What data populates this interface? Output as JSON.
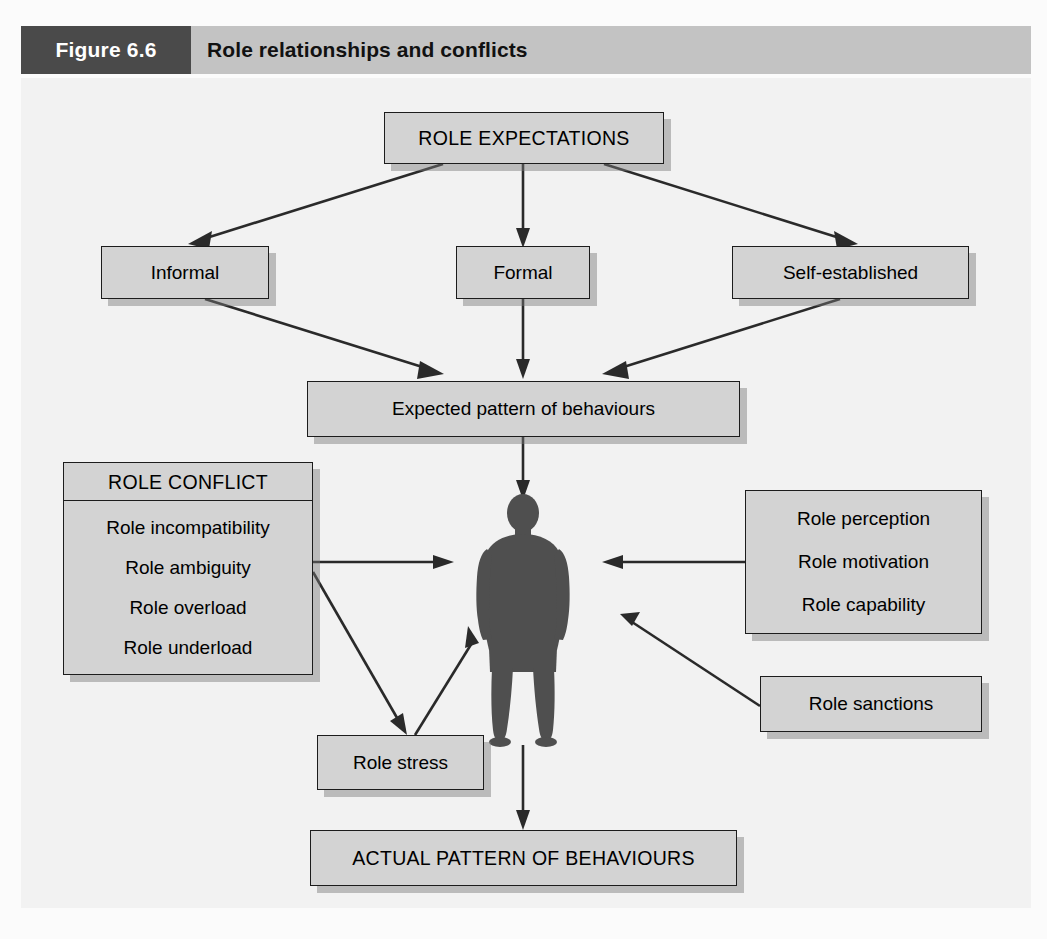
{
  "header": {
    "figure_tag": "Figure 6.6",
    "title": "Role relationships and conflicts"
  },
  "colors": {
    "figure_tag_bg": "#4a4a4a",
    "header_bar_bg": "#c3c3c3",
    "canvas_bg": "#f2f2f2",
    "box_fill": "#d3d3d3",
    "box_border": "#1c1c1c",
    "arrow": "#2a2a2a",
    "person_silhouette": "#4f4f4f"
  },
  "nodes": {
    "role_expectations": {
      "label": "ROLE EXPECTATIONS"
    },
    "informal": {
      "label": "Informal"
    },
    "formal": {
      "label": "Formal"
    },
    "self_established": {
      "label": "Self-established"
    },
    "expected_pattern": {
      "label": "Expected pattern of behaviours"
    },
    "role_conflict": {
      "header": "ROLE CONFLICT",
      "items": [
        "Role incompatibility",
        "Role ambiguity",
        "Role overload",
        "Role underload"
      ]
    },
    "role_attributes": {
      "items": [
        "Role perception",
        "Role motivation",
        "Role capability"
      ]
    },
    "role_sanctions": {
      "label": "Role sanctions"
    },
    "role_stress": {
      "label": "Role stress"
    },
    "actual_pattern": {
      "label": "ACTUAL PATTERN OF BEHAVIOURS"
    },
    "person": {
      "label": "person-silhouette-icon"
    }
  },
  "edges": [
    {
      "from": "role_expectations",
      "to": "informal"
    },
    {
      "from": "role_expectations",
      "to": "formal"
    },
    {
      "from": "role_expectations",
      "to": "self_established"
    },
    {
      "from": "informal",
      "to": "expected_pattern"
    },
    {
      "from": "formal",
      "to": "expected_pattern"
    },
    {
      "from": "self_established",
      "to": "expected_pattern"
    },
    {
      "from": "expected_pattern",
      "to": "person"
    },
    {
      "from": "role_conflict",
      "to": "person"
    },
    {
      "from": "role_conflict",
      "to": "role_stress"
    },
    {
      "from": "role_stress",
      "to": "person"
    },
    {
      "from": "role_attributes",
      "to": "person"
    },
    {
      "from": "role_sanctions",
      "to": "person"
    },
    {
      "from": "person",
      "to": "actual_pattern"
    }
  ]
}
